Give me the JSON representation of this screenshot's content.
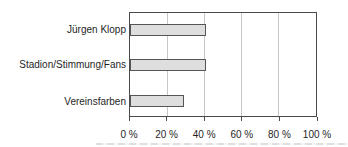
{
  "chart_data": {
    "type": "bar",
    "orientation": "horizontal",
    "title": "",
    "categories": [
      "Jürgen Klopp",
      "Stadion/Stimmung/Fans",
      "Vereinsfarben"
    ],
    "values": [
      40,
      40,
      28
    ],
    "unit": "%",
    "xlim": [
      0,
      100
    ],
    "x_tick_values": [
      0,
      20,
      40,
      60,
      80,
      100
    ],
    "x_tick_labels": [
      "0 %",
      "20 %",
      "40 %",
      "60 %",
      "80 %",
      "100 %"
    ],
    "grid": true,
    "legend": false,
    "colors": {
      "background": "#ffffff",
      "bar_fill": "#dedede",
      "bar_border": "#555555",
      "frame": "#4a4a4a",
      "gridline": "#c6c6c6",
      "tick": "#4a4a4a",
      "text": "#1f1f1f"
    }
  }
}
